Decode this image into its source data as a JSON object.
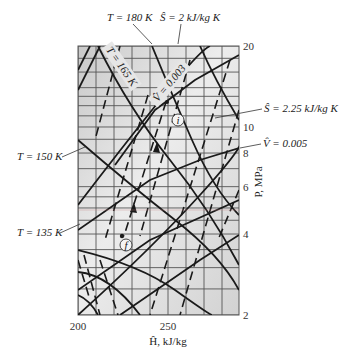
{
  "chart_data": {
    "type": "line",
    "title": "",
    "subtitle": "Pressure-enthalpy diagram (portion) with isotherms, isentropes and isochores",
    "xlabel": "Ĥ, kJ/kg",
    "ylabel": "P, MPa",
    "xlim": [
      200,
      290
    ],
    "ylim": [
      2,
      20
    ],
    "yscale": "log",
    "grid": true,
    "x_ticks": [
      {
        "value": 200,
        "label": "200"
      },
      {
        "value": 250,
        "label": "250"
      }
    ],
    "y_ticks": [
      {
        "value": 20,
        "label": "20"
      },
      {
        "value": 10,
        "label": "10"
      },
      {
        "value": 8,
        "label": "8"
      },
      {
        "value": 6,
        "label": "6"
      },
      {
        "value": 4,
        "label": "4"
      },
      {
        "value": 2,
        "label": "2"
      }
    ],
    "annotations": [
      {
        "id": "t180",
        "text": "T = 180 K",
        "type": "isotherm"
      },
      {
        "id": "s2",
        "text": "Ŝ = 2 kJ/kg K",
        "type": "isentrope"
      },
      {
        "id": "t165",
        "text": "T = 165 K",
        "type": "isotherm"
      },
      {
        "id": "v0003",
        "text": "V̂ = 0.003",
        "type": "isochore"
      },
      {
        "id": "s225",
        "text": "Ŝ = 2.25 kJ/kg K",
        "type": "isentrope"
      },
      {
        "id": "t150",
        "text": "T = 150 K",
        "type": "isotherm"
      },
      {
        "id": "v0005",
        "text": "V̂ = 0.005",
        "type": "isochore"
      },
      {
        "id": "t135",
        "text": "T = 135 K",
        "type": "isotherm"
      }
    ],
    "points": [
      {
        "label": "i",
        "H": 238,
        "P": 10.5
      },
      {
        "label": "f",
        "H": 225,
        "P": 4.4
      }
    ],
    "path": {
      "from": "i",
      "to": "f",
      "style": "dashed",
      "arrows": 2
    },
    "series": [
      {
        "name": "T = 180 K",
        "style": "solid",
        "points": [
          [
            240,
            20
          ],
          [
            248,
            14
          ],
          [
            262,
            8
          ],
          [
            289,
            4.2
          ]
        ]
      },
      {
        "name": "T = 165 K",
        "style": "solid",
        "points": [
          [
            211,
            20
          ],
          [
            230,
            11
          ],
          [
            250,
            7
          ],
          [
            289,
            3.5
          ]
        ]
      },
      {
        "name": "T = 150 K",
        "style": "solid",
        "points": [
          [
            200,
            12
          ],
          [
            220,
            7.5
          ],
          [
            250,
            5
          ],
          [
            289,
            3.0
          ]
        ]
      },
      {
        "name": "T = 135 K",
        "style": "solid",
        "points": [
          [
            200,
            5.3
          ],
          [
            220,
            4.6
          ],
          [
            245,
            3.7
          ],
          [
            270,
            2.6
          ],
          [
            278,
            2
          ]
        ]
      },
      {
        "name": "Ŝ = 2 kJ/kg K",
        "style": "solid",
        "points": [
          [
            200,
            6
          ],
          [
            230,
            13
          ],
          [
            262,
            20
          ]
        ]
      },
      {
        "name": "Ŝ = 2.25 kJ/kg K",
        "style": "solid",
        "points": [
          [
            200,
            2.2
          ],
          [
            240,
            5
          ],
          [
            270,
            8
          ],
          [
            289,
            10.5
          ]
        ]
      },
      {
        "name": "V̂ = 0.003",
        "style": "solid",
        "points": [
          [
            221,
            10
          ],
          [
            250,
            14
          ],
          [
            289,
            18
          ]
        ]
      },
      {
        "name": "V̂ = 0.005",
        "style": "solid",
        "points": [
          [
            200,
            3.3
          ],
          [
            240,
            6.5
          ],
          [
            289,
            9.2
          ]
        ]
      }
    ]
  },
  "labels": {
    "t180": "T = 180 K",
    "s2": "Ŝ = 2 kJ/kg K",
    "t165": "T = 165 K",
    "v0003": "V̂ = 0.003",
    "s225": "Ŝ = 2.25 kJ/kg K",
    "t150": "T = 150 K",
    "v0005": "V̂ = 0.005",
    "t135": "T = 135 K",
    "point_i": "i",
    "point_f": "f",
    "xlabel": "Ĥ, kJ/kg",
    "ylabel": "P, MPa",
    "x200": "200",
    "x250": "250",
    "y20": "20",
    "y10": "10",
    "y8": "8",
    "y6": "6",
    "y4": "4",
    "y2": "2"
  }
}
